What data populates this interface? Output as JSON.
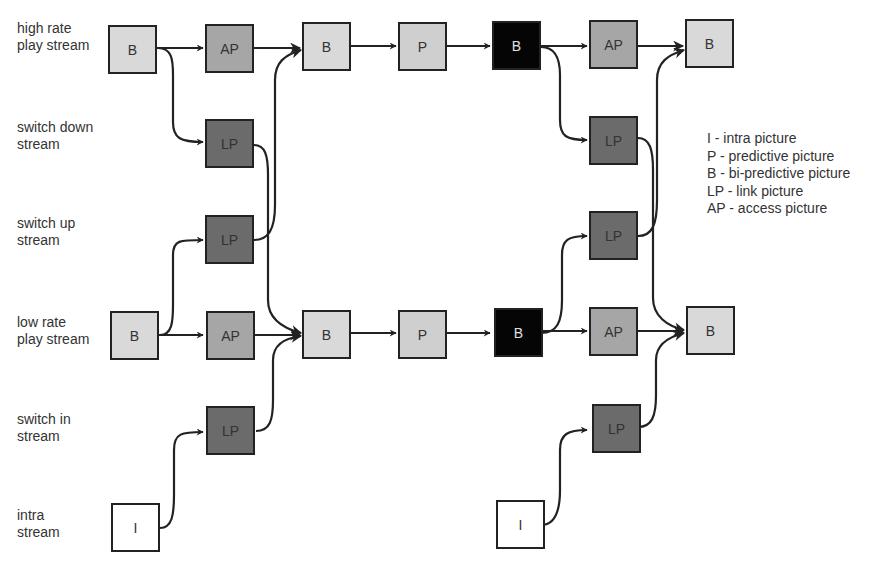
{
  "diagram": {
    "type": "stream-switching-picture-dependency",
    "colors": {
      "B_light": "#d9d9d9",
      "P": "#cfcfcf",
      "AP": "#a6a6a6",
      "LP": "#6b6b6b",
      "B_dark": "#050505",
      "I": "#ffffff",
      "stroke": "#222222"
    },
    "rows": [
      {
        "id": "high",
        "label": "high rate\nplay stream"
      },
      {
        "id": "switch_down",
        "label": "switch down\nstream"
      },
      {
        "id": "switch_up",
        "label": "switch up\nstream"
      },
      {
        "id": "low",
        "label": "low rate\nplay stream"
      },
      {
        "id": "switch_in",
        "label": "switch in\nstream"
      },
      {
        "id": "intra",
        "label": "intra\nstream"
      }
    ],
    "nodes": [
      {
        "id": "h0",
        "label": "B",
        "row": "high",
        "col": 0,
        "kind": "B_light"
      },
      {
        "id": "h1",
        "label": "AP",
        "row": "high",
        "col": 1,
        "kind": "AP"
      },
      {
        "id": "h2",
        "label": "B",
        "row": "high",
        "col": 2,
        "kind": "B_light"
      },
      {
        "id": "h3",
        "label": "P",
        "row": "high",
        "col": 3,
        "kind": "P"
      },
      {
        "id": "h4",
        "label": "B",
        "row": "high",
        "col": 4,
        "kind": "B_dark"
      },
      {
        "id": "h5",
        "label": "AP",
        "row": "high",
        "col": 5,
        "kind": "AP"
      },
      {
        "id": "h6",
        "label": "B",
        "row": "high",
        "col": 6,
        "kind": "B_light"
      },
      {
        "id": "sd1",
        "label": "LP",
        "row": "switch_down",
        "col": 1,
        "kind": "LP"
      },
      {
        "id": "sd5",
        "label": "LP",
        "row": "switch_down",
        "col": 5,
        "kind": "LP"
      },
      {
        "id": "su1",
        "label": "LP",
        "row": "switch_up",
        "col": 1,
        "kind": "LP"
      },
      {
        "id": "su5",
        "label": "LP",
        "row": "switch_up",
        "col": 5,
        "kind": "LP"
      },
      {
        "id": "l0",
        "label": "B",
        "row": "low",
        "col": 0,
        "kind": "B_light"
      },
      {
        "id": "l1",
        "label": "AP",
        "row": "low",
        "col": 1,
        "kind": "AP"
      },
      {
        "id": "l2",
        "label": "B",
        "row": "low",
        "col": 2,
        "kind": "B_light"
      },
      {
        "id": "l3",
        "label": "P",
        "row": "low",
        "col": 3,
        "kind": "P"
      },
      {
        "id": "l4",
        "label": "B",
        "row": "low",
        "col": 4,
        "kind": "B_dark"
      },
      {
        "id": "l5",
        "label": "AP",
        "row": "low",
        "col": 5,
        "kind": "AP"
      },
      {
        "id": "l6",
        "label": "B",
        "row": "low",
        "col": 6,
        "kind": "B_light"
      },
      {
        "id": "si1",
        "label": "LP",
        "row": "switch_in",
        "col": 1,
        "kind": "LP"
      },
      {
        "id": "si5",
        "label": "LP",
        "row": "switch_in",
        "col": 5,
        "kind": "LP"
      },
      {
        "id": "i0",
        "label": "I",
        "row": "intra",
        "col": 0,
        "kind": "I"
      },
      {
        "id": "i4",
        "label": "I",
        "row": "intra",
        "col": 4,
        "kind": "I"
      }
    ],
    "edges": [
      [
        "h0",
        "h1"
      ],
      [
        "h0",
        "sd1"
      ],
      [
        "h1",
        "h2"
      ],
      [
        "h2",
        "h3"
      ],
      [
        "h3",
        "h4"
      ],
      [
        "h4",
        "h5"
      ],
      [
        "h4",
        "sd5"
      ],
      [
        "h5",
        "h6"
      ],
      [
        "l0",
        "l1"
      ],
      [
        "l0",
        "su1"
      ],
      [
        "l1",
        "l2"
      ],
      [
        "l2",
        "l3"
      ],
      [
        "l3",
        "l4"
      ],
      [
        "l4",
        "l5"
      ],
      [
        "l4",
        "su5"
      ],
      [
        "l5",
        "l6"
      ],
      [
        "su1",
        "h2"
      ],
      [
        "sd1",
        "l2"
      ],
      [
        "su5",
        "h6"
      ],
      [
        "sd5",
        "l6"
      ],
      [
        "i0",
        "si1"
      ],
      [
        "si1",
        "l2"
      ],
      [
        "i4",
        "si5"
      ],
      [
        "si5",
        "l6"
      ]
    ]
  },
  "legend": {
    "items": [
      "I - intra picture",
      "P - predictive picture",
      "B - bi-predictive picture",
      "LP - link picture",
      "AP - access picture"
    ]
  }
}
